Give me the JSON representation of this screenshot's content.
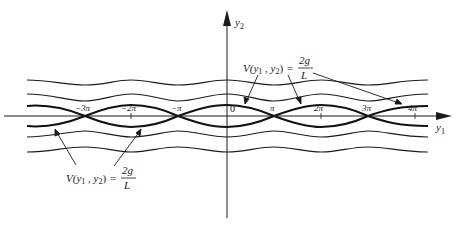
{
  "diagram": {
    "type": "phase-portrait",
    "axes": {
      "x_label": "y",
      "x_label_sub": "1",
      "y_label": "y",
      "y_label_sub": "2",
      "origin_label": "0"
    },
    "ticks": [
      {
        "label": "−3π",
        "value": -3
      },
      {
        "label": "−2π",
        "value": -2
      },
      {
        "label": "−π",
        "value": -1
      },
      {
        "label": "π",
        "value": 1
      },
      {
        "label": "2π",
        "value": 2
      },
      {
        "label": "3π",
        "value": 3
      },
      {
        "label": "4π",
        "value": 4
      }
    ],
    "annotations": {
      "top": {
        "lhs_prefix": "V(y",
        "sub1": "1",
        "mid": " , y",
        "sub2": "2",
        "rhs_close": ")",
        "equals": "=",
        "numerator": "2g",
        "denominator": "L"
      },
      "bottom": {
        "lhs_prefix": "V(y",
        "sub1": "1",
        "mid": " , y",
        "sub2": "2",
        "rhs_close": ")",
        "equals": "=",
        "numerator": "2g",
        "denominator": "L"
      }
    },
    "colors": {
      "ink": "#1a1a1a",
      "background": "#ffffff"
    }
  }
}
